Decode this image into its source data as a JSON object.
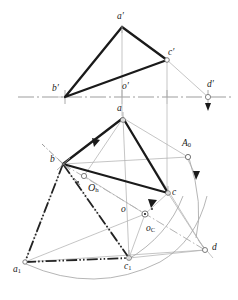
{
  "figure": {
    "background_color": "#ffffff",
    "ink_color": "#1a1a1a",
    "thin_color": "#9a9a9a",
    "dashdot_color": "#2b2b2b",
    "arc_color": "#a8a8a8",
    "width": 238,
    "height": 300
  },
  "labels": [
    {
      "name": "label-a-prime",
      "text": "a",
      "sub": "",
      "prime": "′",
      "x": 117,
      "y": 12,
      "size": 9.5
    },
    {
      "name": "label-b-prime",
      "text": "b",
      "sub": "",
      "prime": "′",
      "x": 52,
      "y": 84,
      "size": 9.5
    },
    {
      "name": "label-c-prime",
      "text": "c",
      "sub": "",
      "prime": "′",
      "x": 168,
      "y": 48,
      "size": 9.5
    },
    {
      "name": "label-d-prime",
      "text": "d",
      "sub": "",
      "prime": "′",
      "x": 207,
      "y": 80,
      "size": 9.5
    },
    {
      "name": "label-o-prime",
      "text": "o",
      "sub": "",
      "prime": "′",
      "x": 122,
      "y": 82,
      "size": 9.5
    },
    {
      "name": "label-a",
      "text": "a",
      "sub": "",
      "prime": "",
      "x": 117,
      "y": 104,
      "size": 9.5
    },
    {
      "name": "label-b",
      "text": "b",
      "sub": "",
      "prime": "",
      "x": 50,
      "y": 155,
      "size": 9.5
    },
    {
      "name": "label-c",
      "text": "c",
      "sub": "",
      "prime": "",
      "x": 172,
      "y": 188,
      "size": 9.5
    },
    {
      "name": "label-d",
      "text": "d",
      "sub": "",
      "prime": "",
      "x": 212,
      "y": 243,
      "size": 9.5
    },
    {
      "name": "label-o",
      "text": "o",
      "sub": "",
      "prime": "",
      "x": 121,
      "y": 205,
      "size": 9.5
    },
    {
      "name": "label-o-c",
      "text": "o",
      "sub": "C",
      "prime": "",
      "x": 146,
      "y": 224,
      "size": 9.5
    },
    {
      "name": "label-o-h",
      "text": "O",
      "sub": "h",
      "prime": "",
      "x": 88,
      "y": 183,
      "size": 10
    },
    {
      "name": "label-a-zero",
      "text": "A",
      "sub": "0",
      "prime": "",
      "x": 182,
      "y": 139,
      "size": 9.5
    },
    {
      "name": "label-a-one",
      "text": "a",
      "sub": "1",
      "prime": "",
      "x": 13,
      "y": 265,
      "size": 9.5
    },
    {
      "name": "label-c-one",
      "text": "c",
      "sub": "1",
      "prime": "",
      "x": 124,
      "y": 262,
      "size": 9.5
    }
  ],
  "points": {
    "a_prime": {
      "x": 122,
      "y": 25
    },
    "b_prime": {
      "x": 65,
      "y": 97
    },
    "c_prime": {
      "x": 167,
      "y": 60
    },
    "d_prime": {
      "x": 208,
      "y": 97
    },
    "a": {
      "x": 123,
      "y": 118
    },
    "b": {
      "x": 63,
      "y": 164
    },
    "c": {
      "x": 168,
      "y": 193
    },
    "d": {
      "x": 205,
      "y": 250
    },
    "o": {
      "x": 135,
      "y": 212
    },
    "o_c": {
      "x": 145,
      "y": 214
    },
    "o_h": {
      "x": 84,
      "y": 176
    },
    "A_0": {
      "x": 188,
      "y": 157
    },
    "a_1": {
      "x": 25,
      "y": 262
    },
    "c_1": {
      "x": 129,
      "y": 258
    }
  },
  "ground_line": {
    "name": "ground-line-x-axis",
    "y": 97,
    "x_start": 18,
    "x_end": 232,
    "style": "dash-dot"
  },
  "upper_triangle": {
    "name": "triangle-a-b-c-prime",
    "vertices": [
      "a_prime",
      "b_prime",
      "c_prime"
    ],
    "stroke_width": 2.2
  },
  "lower_triangle": {
    "name": "triangle-a-b-c",
    "vertices": [
      "a",
      "b",
      "c"
    ],
    "stroke_width": 2.2
  },
  "rotated_triangle": {
    "name": "triangle-b-a1-c1-rotated",
    "vertices": [
      "b",
      "a_1",
      "c_1"
    ],
    "style": "dash-dot-dot"
  },
  "tick_marks": [
    {
      "name": "tick-a-prime",
      "x": 122,
      "y": 97
    },
    {
      "name": "tick-b-prime",
      "x": 65,
      "y": 97
    },
    {
      "name": "tick-c-prime",
      "x": 167,
      "y": 97
    },
    {
      "name": "tick-d-prime",
      "x": 208,
      "y": 97
    }
  ],
  "arrows": [
    {
      "name": "arrow-d-prime-down",
      "x": 208,
      "y": 104
    },
    {
      "name": "arrow-a0-down",
      "x": 196,
      "y": 179
    },
    {
      "name": "arrow-ab-direction",
      "x": 95,
      "y": 142
    },
    {
      "name": "arrow-oc-direction",
      "x": 152,
      "y": 205
    }
  ],
  "arcs": [
    {
      "name": "arc-a0-to-a1",
      "note": "rotation arc from A0 sweeping to a1"
    },
    {
      "name": "arc-c-to-c1",
      "note": "rotation arc from c sweeping to c1"
    }
  ]
}
